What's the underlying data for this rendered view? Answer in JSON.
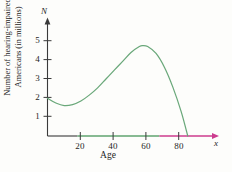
{
  "figure": {
    "background_color": "#fdfdfb",
    "curve_color": "#6aa87a",
    "axis_color": "#3a3a3a",
    "axis_green_color": "#5fa36f",
    "axis_magenta_color": "#cc3b8e"
  },
  "axes": {
    "y_variable": "N",
    "x_variable": "x",
    "y_title_line1": "Number of hearing-impaired",
    "y_title_line2": "Americans (in millions)",
    "x_title": "Age",
    "y_ticks": [
      "1",
      "2",
      "3",
      "4",
      "5"
    ],
    "x_ticks": [
      "20",
      "40",
      "60",
      "80"
    ]
  },
  "chart_data": {
    "type": "line",
    "title": "",
    "xlabel": "Age",
    "ylabel": "Number of hearing-impaired Americans (in millions)",
    "xlim": [
      0,
      100
    ],
    "ylim": [
      0,
      5.8
    ],
    "x_tick_values": [
      20,
      40,
      60,
      80
    ],
    "y_tick_values": [
      1,
      2,
      3,
      4,
      5
    ],
    "grid": false,
    "legend": "none",
    "series": [
      {
        "name": "Number of hearing-impaired Americans",
        "color": "#6aa87a",
        "points": [
          {
            "x": 0,
            "y": 1.92
          },
          {
            "x": 5,
            "y": 1.68
          },
          {
            "x": 10,
            "y": 1.55
          },
          {
            "x": 15,
            "y": 1.6
          },
          {
            "x": 20,
            "y": 1.78
          },
          {
            "x": 25,
            "y": 2.08
          },
          {
            "x": 30,
            "y": 2.45
          },
          {
            "x": 35,
            "y": 2.9
          },
          {
            "x": 40,
            "y": 3.35
          },
          {
            "x": 45,
            "y": 3.8
          },
          {
            "x": 50,
            "y": 4.25
          },
          {
            "x": 55,
            "y": 4.55
          },
          {
            "x": 57,
            "y": 4.6
          },
          {
            "x": 60,
            "y": 4.55
          },
          {
            "x": 65,
            "y": 4.2
          },
          {
            "x": 70,
            "y": 3.5
          },
          {
            "x": 75,
            "y": 2.5
          },
          {
            "x": 80,
            "y": 1.25
          },
          {
            "x": 84,
            "y": 0
          }
        ]
      }
    ],
    "annotations": {
      "local_minimum": {
        "x": 10,
        "y": 1.55
      },
      "local_maximum": {
        "x": 57,
        "y": 4.6
      },
      "x_intercept": {
        "x": 84,
        "y": 0
      }
    },
    "axis_segments": [
      {
        "from": 0,
        "to": 18,
        "color": "#3a3a3a"
      },
      {
        "from": 18,
        "to": 67,
        "color": "#5fa36f"
      },
      {
        "from": 67,
        "to": 100,
        "color": "#cc3b8e"
      }
    ]
  }
}
